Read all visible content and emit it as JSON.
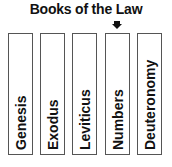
{
  "title": "Books of the Law",
  "indicator": {
    "icon": "down-arrow-icon",
    "points_to_index": 3
  },
  "books": [
    {
      "label": "Genesis",
      "x": 8
    },
    {
      "label": "Exodus",
      "x": 40
    },
    {
      "label": "Leviticus",
      "x": 72
    },
    {
      "label": "Numbers",
      "x": 105
    },
    {
      "label": "Deuteronomy",
      "x": 137
    }
  ]
}
